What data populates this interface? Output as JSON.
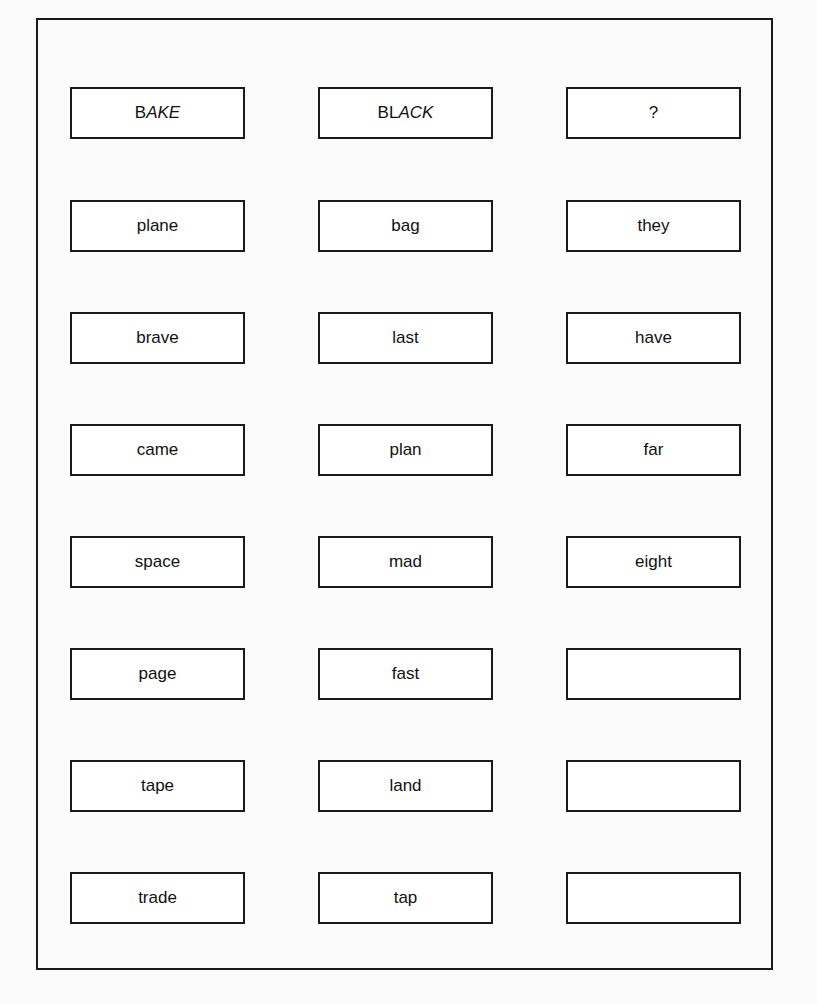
{
  "header": [
    {
      "first": "B",
      "rest": "AKE"
    },
    {
      "first": "BL",
      "rest": "ACK"
    },
    {
      "first": "?",
      "rest": ""
    }
  ],
  "rows": [
    [
      "plane",
      "bag",
      "they"
    ],
    [
      "brave",
      "last",
      "have"
    ],
    [
      "came",
      "plan",
      "far"
    ],
    [
      "space",
      "mad",
      "eight"
    ],
    [
      "page",
      "fast",
      ""
    ],
    [
      "tape",
      "land",
      ""
    ],
    [
      "trade",
      "tap",
      ""
    ]
  ]
}
